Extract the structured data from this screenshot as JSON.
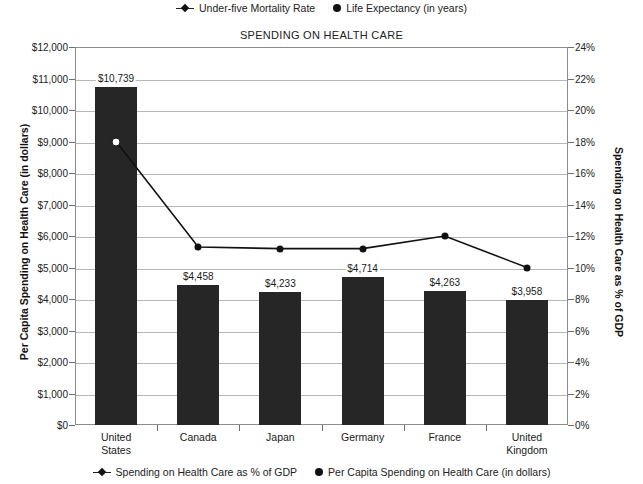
{
  "legend_top": [
    {
      "label": "Under-five Mortality Rate",
      "marker": "line-with-diamond-marker"
    },
    {
      "label": "Life Expectancy (in years)",
      "marker": "filled-circle-marker"
    }
  ],
  "legend_bottom": [
    {
      "label": "Spending on Health Care as % of GDP",
      "marker": "line-with-diamond-marker"
    },
    {
      "label": "Per Capita Spending on Health Care (in dollars)",
      "marker": "filled-circle-marker"
    }
  ],
  "chart_data": {
    "type": "bar",
    "title": "SPENDING ON HEALTH CARE",
    "categories": [
      "United States",
      "Canada",
      "Japan",
      "Germany",
      "France",
      "United Kingdom"
    ],
    "xlabel": "",
    "ylabel": "Per Capita Spending on Health Care (in dollars)",
    "ylabel_right": "Spending on Health Care as % of GDP",
    "ylim": [
      0,
      12000
    ],
    "ylim_right": [
      0,
      24
    ],
    "grid": true,
    "legend_position": "top and bottom",
    "yticks": [
      "$0",
      "$1,000",
      "$2,000",
      "$3,000",
      "$4,000",
      "$5,000",
      "$6,000",
      "$7,000",
      "$8,000",
      "$9,000",
      "$10,000",
      "$11,000",
      "$12,000"
    ],
    "ytick_values": [
      0,
      1000,
      2000,
      3000,
      4000,
      5000,
      6000,
      7000,
      8000,
      9000,
      10000,
      11000,
      12000
    ],
    "yticks_right": [
      "0%",
      "2%",
      "4%",
      "6%",
      "8%",
      "10%",
      "12%",
      "14%",
      "16%",
      "18%",
      "20%",
      "22%",
      "24%"
    ],
    "ytick_values_right": [
      0,
      2,
      4,
      6,
      8,
      10,
      12,
      14,
      16,
      18,
      20,
      22,
      24
    ],
    "series": [
      {
        "name": "Per Capita Spending on Health Care (in dollars)",
        "type": "bar",
        "axis": "left",
        "values": [
          10739,
          4458,
          4233,
          4714,
          4263,
          3958
        ],
        "labels": [
          "$10,739",
          "$4,458",
          "$4,233",
          "$4,714",
          "$4,263",
          "$3,958"
        ],
        "color": "#262626"
      },
      {
        "name": "Spending on Health Care as % of GDP",
        "type": "line",
        "axis": "right",
        "values": [
          18.0,
          11.3,
          11.2,
          11.2,
          12.0,
          10.0
        ],
        "color": "#111111"
      }
    ]
  }
}
